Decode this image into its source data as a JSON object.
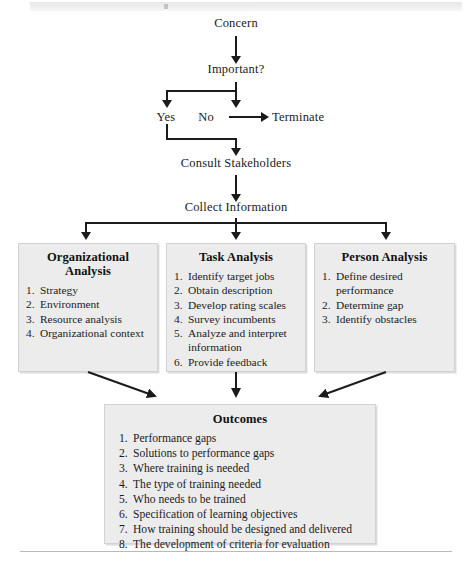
{
  "figure": {
    "type": "flowchart"
  },
  "flow_nodes": {
    "concern": "Concern",
    "important": "Important?",
    "yes": "Yes",
    "no": "No",
    "terminate": "Terminate",
    "consult": "Consult Stakeholders",
    "collect": "Collect Information"
  },
  "boxes": [
    {
      "id": "organizational-analysis",
      "title_line1": "Organizational",
      "title_line2": "Analysis",
      "items": [
        "Strategy",
        "Environment",
        "Resource analysis",
        "Organizational context"
      ]
    },
    {
      "id": "task-analysis",
      "title_line1": "Task Analysis",
      "title_line2": "",
      "items": [
        "Identify target jobs",
        "Obtain description",
        "Develop rating scales",
        "Survey incumbents",
        "Analyze and interpret information",
        "Provide feedback"
      ]
    },
    {
      "id": "person-analysis",
      "title_line1": "Person Analysis",
      "title_line2": "",
      "items": [
        "Define desired performance",
        "Determine gap",
        "Identify obstacles"
      ]
    }
  ],
  "outcomes": {
    "title": "Outcomes",
    "items": [
      "Performance gaps",
      "Solutions to performance gaps",
      "Where training is needed",
      "The type of training needed",
      "Who needs to be trained",
      "Specification of learning objectives",
      "How training should be designed and delivered",
      "The development of criteria for evaluation"
    ]
  },
  "colors": {
    "box_fill": "#ececec",
    "box_border": "#d2d2d2",
    "line": "#1b1b1b",
    "text": "#1b1b1b",
    "rule": "#b9b9b9"
  }
}
